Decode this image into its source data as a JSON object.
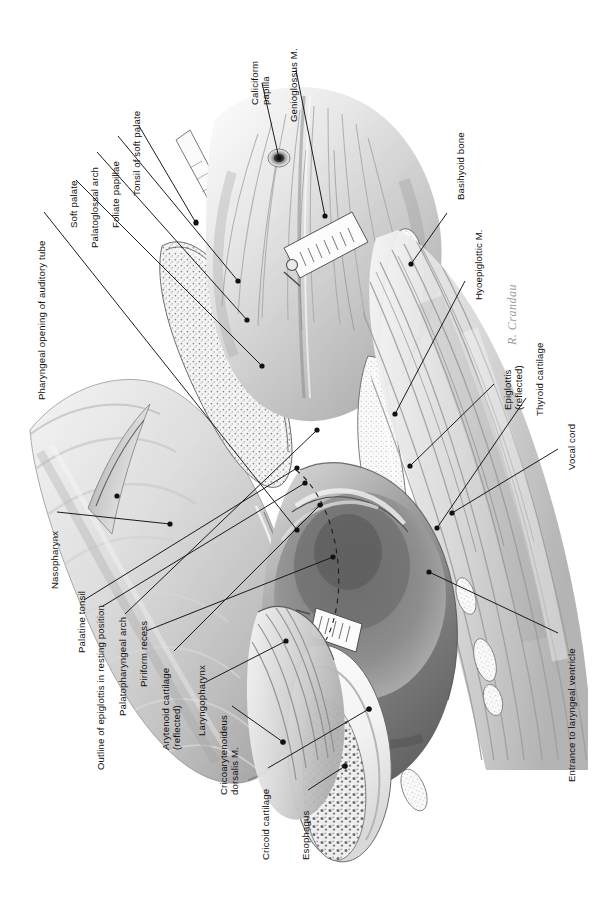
{
  "header": {
    "folio": "130",
    "running_title": "ANATOMY AND PHYSIOLOGY OF DOMESTIC ANIMALS"
  },
  "figure": {
    "signature": "R. Crandau",
    "orientation": "labels rotated 90 degrees counter-clockwise",
    "ink_color": "#111111",
    "paper_color": "#ffffff"
  },
  "labels": [
    {
      "id": "pharyngeal-opening-of-auditory-tube",
      "text": "Pharyngeal opening of auditory tube",
      "side": "left",
      "x": 36,
      "y": 400,
      "anchor": [
        297,
        530
      ],
      "leader": [
        [
          44,
          212
        ],
        [
          297,
          530
        ]
      ]
    },
    {
      "id": "soft-palate",
      "text": "Soft palate",
      "side": "left",
      "x": 68,
      "y": 228,
      "anchor": [
        262,
        366
      ],
      "leader": [
        [
          76,
          180
        ],
        [
          262,
          366
        ]
      ]
    },
    {
      "id": "palatoglossal-arch",
      "text": "Palatoglossal arch",
      "side": "left",
      "x": 89,
      "y": 248,
      "anchor": [
        247,
        320
      ],
      "leader": [
        [
          97,
          152
        ],
        [
          247,
          320
        ]
      ]
    },
    {
      "id": "foliate-papillae",
      "text": "Foliate papillae",
      "side": "left",
      "x": 110,
      "y": 228,
      "anchor": [
        238,
        281
      ],
      "leader": [
        [
          118,
          136
        ],
        [
          238,
          281
        ]
      ]
    },
    {
      "id": "tonsil-of-soft-palate",
      "text": "Tonsil of soft palate",
      "side": "left",
      "x": 131,
      "y": 196,
      "anchor": [
        196,
        223
      ],
      "leader": [
        [
          139,
          126
        ],
        [
          196,
          223
        ]
      ]
    },
    {
      "id": "caliciform-papilla",
      "text": "Caliciform\npapilla",
      "side": "top",
      "x": 249,
      "y": 105,
      "anchor": [
        279,
        158
      ],
      "leader": [
        [
          262,
          83
        ],
        [
          279,
          158
        ]
      ]
    },
    {
      "id": "genioglossus-m",
      "text": "Genioglossus M.",
      "side": "top",
      "x": 288,
      "y": 122,
      "anchor": [
        325,
        216
      ],
      "leader": [
        [
          296,
          70
        ],
        [
          325,
          216
        ]
      ]
    },
    {
      "id": "basihyoid-bone",
      "text": "Basihyoid bone",
      "side": "right",
      "x": 455,
      "y": 200,
      "anchor": [
        411,
        264
      ],
      "leader": [
        [
          447,
          213
        ],
        [
          411,
          264
        ]
      ]
    },
    {
      "id": "hyoepiglottic-m",
      "text": "Hyoepiglottic M.",
      "side": "right",
      "x": 473,
      "y": 300,
      "anchor": [
        395,
        414
      ],
      "leader": [
        [
          465,
          281
        ],
        [
          395,
          414
        ]
      ]
    },
    {
      "id": "epiglottis-reflected",
      "text": "Epiglottis\n(reflected)",
      "side": "right",
      "x": 502,
      "y": 410,
      "anchor": [
        410,
        466
      ],
      "leader": [
        [
          494,
          384
        ],
        [
          410,
          466
        ]
      ]
    },
    {
      "id": "thyroid-cartilage",
      "text": "Thyroid cartilage",
      "side": "right",
      "x": 534,
      "y": 416,
      "anchor": [
        437,
        528
      ],
      "leader": [
        [
          526,
          398
        ],
        [
          437,
          528
        ]
      ]
    },
    {
      "id": "vocal-cord",
      "text": "Vocal cord",
      "side": "right",
      "x": 566,
      "y": 470,
      "anchor": [
        452,
        513
      ],
      "leader": [
        [
          558,
          449
        ],
        [
          452,
          513
        ]
      ]
    },
    {
      "id": "entrance-to-laryngeal-ventricle",
      "text": "Entrance to laryngeal ventricle",
      "side": "right",
      "x": 566,
      "y": 782,
      "anchor": [
        429,
        572
      ],
      "leader": [
        [
          558,
          633
        ],
        [
          429,
          572
        ]
      ]
    },
    {
      "id": "nasopharynx",
      "text": "Nasopharynx",
      "side": "left",
      "x": 49,
      "y": 589,
      "anchor": [
        170,
        524
      ],
      "leader": [
        [
          57,
          512
        ],
        [
          170,
          524
        ]
      ]
    },
    {
      "id": "palatine-tonsil",
      "text": "Palatine tonsil",
      "side": "left",
      "x": 76,
      "y": 653,
      "anchor": [
        297,
        468
      ],
      "leader": [
        [
          84,
          600
        ],
        [
          297,
          468
        ]
      ]
    },
    {
      "id": "outline-of-epiglottis-in-resting-position",
      "text": "Outline of epiglottis in resting position",
      "side": "left",
      "x": 95,
      "y": 770,
      "anchor": [
        305,
        483
      ],
      "leader": [
        [
          103,
          606
        ],
        [
          305,
          483
        ]
      ]
    },
    {
      "id": "palatopharyngeal-arch",
      "text": "Palatopharyngeal arch",
      "side": "left",
      "x": 117,
      "y": 716,
      "anchor": [
        317,
        430
      ],
      "leader": [
        [
          125,
          614
        ],
        [
          317,
          430
        ]
      ]
    },
    {
      "id": "piriform-recess",
      "text": "Piriform recess",
      "side": "left",
      "x": 138,
      "y": 687,
      "anchor": [
        333,
        557
      ],
      "leader": [
        [
          146,
          631
        ],
        [
          333,
          557
        ]
      ]
    },
    {
      "id": "arytenoid-cartilage-reflected",
      "text": "Arytenoid cartilage\n(reflected)",
      "side": "left",
      "x": 160,
      "y": 750,
      "anchor": [
        320,
        505
      ],
      "leader": [
        [
          174,
          651
        ],
        [
          320,
          505
        ]
      ]
    },
    {
      "id": "laryngopharynx",
      "text": "Laryngopharynx",
      "side": "left",
      "x": 196,
      "y": 736,
      "anchor": [
        286,
        641
      ],
      "leader": [
        [
          204,
          683
        ],
        [
          286,
          641
        ]
      ]
    },
    {
      "id": "cricoarytenoideus-dorsalis-m",
      "text": "Cricoarytenoideus\ndorsalis M.",
      "side": "left",
      "x": 218,
      "y": 795,
      "anchor": [
        283,
        742
      ],
      "leader": [
        [
          232,
          706
        ],
        [
          283,
          742
        ]
      ]
    },
    {
      "id": "cricoid-cartilage",
      "text": "Cricoid cartilage",
      "side": "left",
      "x": 260,
      "y": 860,
      "anchor": [
        369,
        709
      ],
      "leader": [
        [
          268,
          768
        ],
        [
          369,
          709
        ]
      ]
    },
    {
      "id": "esophagus",
      "text": "Esophagus",
      "side": "left",
      "x": 300,
      "y": 860,
      "anchor": [
        345,
        766
      ],
      "leader": [
        [
          308,
          790
        ],
        [
          345,
          766
        ]
      ]
    }
  ]
}
